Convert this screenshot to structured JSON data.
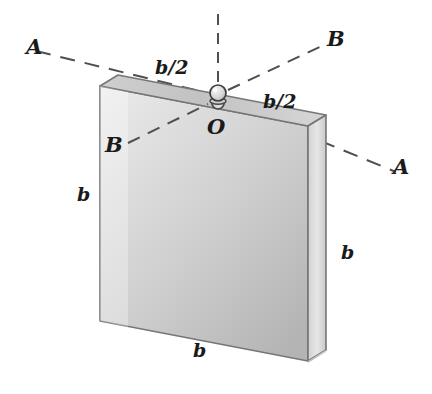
{
  "figure": {
    "background_color": "#ffffff",
    "ink_color": "#1a1a1a"
  },
  "plate": {
    "shape": "square-plate",
    "face_color_light": "#e8e8e8",
    "face_color_dark": "#a8a8a8",
    "top_edge_color": "#c4c4c4",
    "side_edge_color": "#dedede",
    "outline_color": "#6e6e6e"
  },
  "support": {
    "pin_name": "pin-at-O",
    "pin_color": "#d8d8d8",
    "pin_outline": "#4a4a4a"
  },
  "axes": [
    {
      "name": "axis-A-A",
      "style": "dashed",
      "label_start": "A",
      "label_end": "A"
    },
    {
      "name": "axis-B-B",
      "style": "dashed",
      "label_start": "B",
      "label_end": "B"
    },
    {
      "name": "axis-vertical",
      "style": "dashed",
      "label_start": "",
      "label_end": ""
    }
  ],
  "labels": {
    "axis_a_left": "A",
    "axis_a_right": "A",
    "axis_b_upper_right": "B",
    "axis_b_lower_left": "B",
    "origin": "O",
    "half_width_left": "b/2",
    "half_width_right": "b/2",
    "height_left": "b",
    "height_right": "b",
    "width_bottom": "b"
  }
}
